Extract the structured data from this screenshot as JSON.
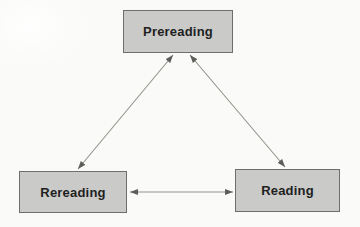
{
  "diagram": {
    "type": "cycle-diagram",
    "nodes": [
      {
        "id": "prereading",
        "label": "Prereading",
        "position": "top-center"
      },
      {
        "id": "rereading",
        "label": "Rereading",
        "position": "bottom-left"
      },
      {
        "id": "reading",
        "label": "Reading",
        "position": "bottom-right"
      }
    ],
    "edges": [
      {
        "from": "prereading",
        "to": "rereading",
        "bidirectional": true
      },
      {
        "from": "prereading",
        "to": "reading",
        "bidirectional": true
      },
      {
        "from": "rereading",
        "to": "reading",
        "bidirectional": true
      }
    ],
    "colors": {
      "background": "#fafaf8",
      "node_fill": "#cacac8",
      "node_border": "#6e6e6c",
      "node_text": "#1f1f1f",
      "arrow_line": "#92928c",
      "arrow_head": "#5c5c59"
    }
  }
}
